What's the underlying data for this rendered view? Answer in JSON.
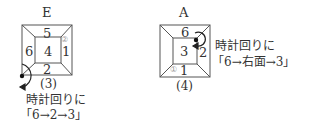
{
  "figures": [
    {
      "title": "E",
      "number": "(3)",
      "faces": {
        "top": "5",
        "center": "4",
        "left": "6",
        "right": "1",
        "bottom": "2"
      },
      "marker": "②",
      "caption_line1": "時計回りに",
      "caption_line2": "「6→2→3」"
    },
    {
      "title": "A",
      "number": "(4)",
      "faces": {
        "top": "6",
        "center": "3",
        "right": "2",
        "bottom": "1"
      },
      "marker": "①",
      "caption_line1": "時計回りに",
      "caption_line2": "「6→右面→3」"
    }
  ],
  "colors": {
    "line": "#555555",
    "text": "#333333",
    "marker": "#999999"
  }
}
